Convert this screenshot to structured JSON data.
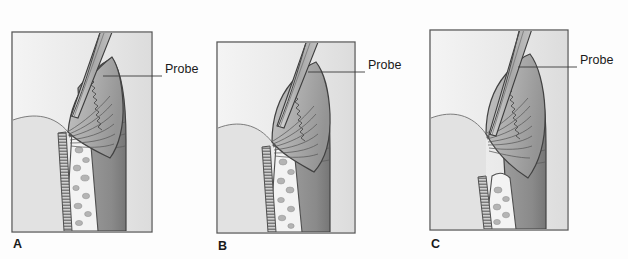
{
  "figure": {
    "type": "medical-illustration",
    "background_color": "#fdfdfd",
    "frame_border_color": "#595959",
    "label_color": "#1a1a1a"
  },
  "panels": [
    {
      "id": "a",
      "label": "A",
      "callout_label": "Probe",
      "frame": {
        "x": 12,
        "y": 32,
        "w": 140,
        "h": 200
      },
      "label_pos": {
        "x": 13,
        "y": 238
      },
      "callout_text_pos": {
        "x": 165,
        "y": 70
      },
      "leader": {
        "x1": 103,
        "y1": 76,
        "x2": 162,
        "y2": 76
      },
      "description": "Shallow sulcus, probe tip at healthy sulcus base"
    },
    {
      "id": "b",
      "label": "B",
      "callout_label": "Probe",
      "frame": {
        "x": 217,
        "y": 42,
        "w": 138,
        "h": 191
      },
      "label_pos": {
        "x": 218,
        "y": 240
      },
      "callout_text_pos": {
        "x": 368,
        "y": 66
      },
      "leader": {
        "x1": 308,
        "y1": 72,
        "x2": 365,
        "y2": 72
      },
      "description": "Deeper probe penetration with inflamed enlarged gingiva"
    },
    {
      "id": "c",
      "label": "C",
      "callout_label": "Probe",
      "frame": {
        "x": 430,
        "y": 30,
        "w": 138,
        "h": 200
      },
      "label_pos": {
        "x": 431,
        "y": 238
      },
      "callout_text_pos": {
        "x": 580,
        "y": 61
      },
      "leader": {
        "x1": 518,
        "y1": 67,
        "x2": 577,
        "y2": 67
      },
      "description": "Deepest pocket with apical attachment and bone loss"
    }
  ],
  "colors": {
    "outline": "#4a4a4a",
    "gingiva_light": "#c9c9c9",
    "gingiva_mid": "#a8a8a8",
    "gingiva_dark": "#8f8f8f",
    "tooth_dark": "#8a8a8a",
    "tooth_shadow": "#787878",
    "bone_fill": "#f2f2f2",
    "bone_speckle": "#b0b0b0",
    "pdl_hatch": "#6e6e6e",
    "probe_metal": "#b9b9b9",
    "probe_outline": "#3d3d3d",
    "mucosa_light": "#e6e6e6"
  }
}
